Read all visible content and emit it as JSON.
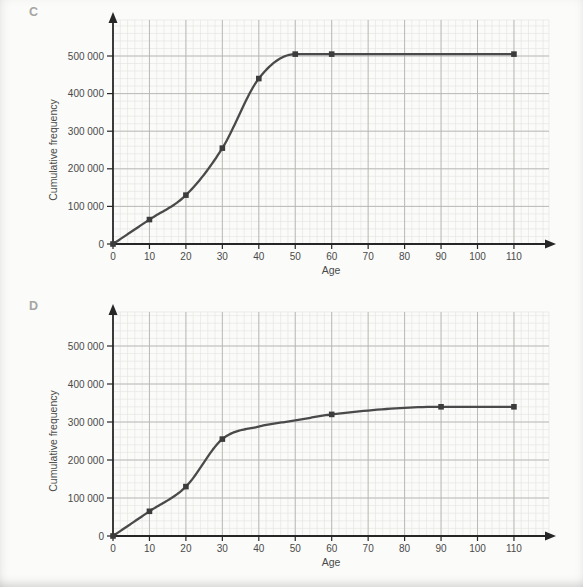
{
  "page": {
    "background_color": "#fbfbf9",
    "description_colors": {
      "curve": "#4a4a4a",
      "marker": "#3c3c3c",
      "axis": "#262626",
      "grid_major": "#b4b4b1",
      "grid_minor": "#e3e3e0",
      "text": "#4a4a4a",
      "panel_letter": "#a6a6a3"
    }
  },
  "chart_data": [
    {
      "type": "line",
      "panel_label": "C",
      "xlabel": "Age",
      "ylabel": "Cumulative frequency",
      "xlim": [
        0,
        120
      ],
      "ylim": [
        0,
        560000
      ],
      "grid": true,
      "legend": null,
      "x_ticks": [
        0,
        10,
        20,
        30,
        40,
        50,
        60,
        70,
        80,
        90,
        100,
        110
      ],
      "x_tick_labels": [
        "0",
        "10",
        "20",
        "30",
        "40",
        "50",
        "60",
        "70",
        "80",
        "90",
        "100",
        "110"
      ],
      "y_ticks": [
        0,
        100000,
        200000,
        300000,
        400000,
        500000
      ],
      "y_tick_labels": [
        "0",
        "100 000",
        "200 000",
        "300 000",
        "400 000",
        "500 000"
      ],
      "x": [
        0,
        10,
        20,
        30,
        40,
        50,
        60,
        110
      ],
      "y": [
        0,
        65000,
        130000,
        255000,
        440000,
        505000,
        505000,
        505000
      ],
      "curve_x": [
        0,
        10,
        20,
        30,
        40,
        50,
        60,
        110
      ],
      "curve_y": [
        0,
        65000,
        130000,
        255000,
        440000,
        505000,
        505000,
        505000
      ]
    },
    {
      "type": "line",
      "panel_label": "D",
      "xlabel": "Age",
      "ylabel": "Cumulative frequency",
      "xlim": [
        0,
        120
      ],
      "ylim": [
        0,
        560000
      ],
      "grid": true,
      "legend": null,
      "x_ticks": [
        0,
        10,
        20,
        30,
        40,
        50,
        60,
        70,
        80,
        90,
        100,
        110
      ],
      "x_tick_labels": [
        "0",
        "10",
        "20",
        "30",
        "40",
        "50",
        "60",
        "70",
        "80",
        "90",
        "100",
        "110"
      ],
      "y_ticks": [
        0,
        100000,
        200000,
        300000,
        400000,
        500000
      ],
      "y_tick_labels": [
        "0",
        "100 000",
        "200 000",
        "300 000",
        "400 000",
        "500 000"
      ],
      "x": [
        0,
        10,
        20,
        30,
        60,
        90,
        110
      ],
      "y": [
        0,
        65000,
        130000,
        255000,
        320000,
        340000,
        340000
      ],
      "curve_x": [
        0,
        10,
        20,
        30,
        40,
        50,
        60,
        90,
        110
      ],
      "curve_y": [
        0,
        65000,
        130000,
        255000,
        288000,
        304000,
        320000,
        340000,
        340000
      ]
    }
  ]
}
